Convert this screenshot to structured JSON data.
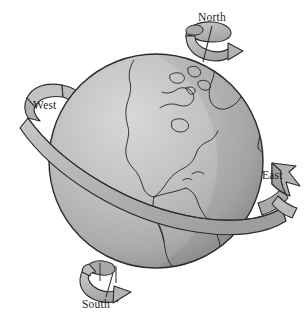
{
  "figure": {
    "background_color": "#ffffff"
  },
  "labels": {
    "north": "North",
    "west": "West",
    "east": "East",
    "south": "South"
  },
  "colors": {
    "outline": "#2b2b2b",
    "ocean_light": "#cfcfcf",
    "ocean_mid": "#b3b3b3",
    "ocean_dark": "#8f8f8f",
    "ribbon_light": "#c9c9c9",
    "ribbon_mid": "#b0b0b0",
    "ribbon_dark": "#949494",
    "arrow_fill": "#b8b8b8",
    "leader_line": "#3a3a3a",
    "text": "#1c1c1c"
  },
  "elements": {
    "globe": "earth-sphere",
    "north_arrow": "north-rotation-arrow",
    "south_arrow": "south-rotation-arrow",
    "ribbon": "equatorial-ribbon-band",
    "west_tail": "ribbon-west-tail",
    "east_arrowhead": "ribbon-east-arrowhead",
    "north_leader": "north-leader-line",
    "south_leader": "south-leader-line"
  },
  "geography": {
    "landmasses": [
      "North America",
      "South America",
      "Greenland",
      "Western Europe",
      "Northwest Africa",
      "Caribbean islands"
    ]
  }
}
